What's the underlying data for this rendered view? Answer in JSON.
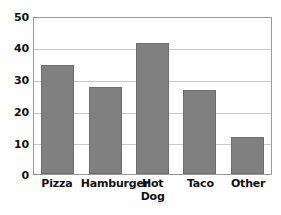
{
  "chart_data": {
    "type": "bar",
    "title": "",
    "subtitle": "",
    "xlabel": "",
    "ylabel": "",
    "categories": [
      "Pizza",
      "Hamburger",
      "Hot\nDog",
      "Taco",
      "Other"
    ],
    "values": [
      35,
      28,
      42,
      27,
      12
    ],
    "ylim": [
      0,
      50
    ],
    "y_ticks": [
      50,
      40,
      30,
      20,
      10,
      0
    ],
    "y_tick_labels": [
      "50",
      "40",
      "30",
      "20",
      "10",
      "0"
    ],
    "gridlines": [
      10,
      20,
      30,
      40
    ],
    "grid": true,
    "legend": null,
    "legend_position": "none",
    "annotations": [],
    "colors": {
      "bar_fill": "#808080",
      "bar_edge": "#6e6e6e",
      "gridline": "#c9c9c9",
      "frame": "#9a9a9a",
      "text": "#111111",
      "background": "#ffffff"
    }
  }
}
